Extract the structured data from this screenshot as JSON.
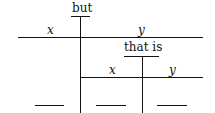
{
  "diagram": {
    "conjunction_top": "but",
    "conjunction_mid": "that is",
    "top_left_var": "x",
    "top_right_var": "y",
    "mid_left_var": "x",
    "mid_right_var": "y"
  }
}
